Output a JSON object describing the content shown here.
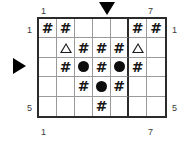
{
  "puzzle": {
    "title": "grid-puzzle",
    "rows": 5,
    "columns": 7,
    "colors": {
      "border": "#2b2b2b",
      "gridline": "#9a9a9a",
      "glyph": "#0d0d0d",
      "label": "#3a3a3a",
      "background": "#ffffff"
    },
    "labels": {
      "top_left": "1",
      "top_right": "7",
      "bottom_left": "1",
      "bottom_right": "7",
      "left_top": "1",
      "left_bottom": "5",
      "right_top": "1",
      "right_bottom": "5"
    },
    "markers": {
      "top_arrow": "down-triangle-marker",
      "top_arrow_column": 4,
      "left_arrow": "right-triangle-marker",
      "left_arrow_row": 3
    },
    "thick_divider_after_column": 5,
    "glyph_names": {
      "hash": "hash-glyph",
      "disc": "filled-circle-glyph",
      "triangle": "open-triangle-glyph",
      "empty": "empty-cell"
    },
    "glyph_chars": {
      "hash": "#"
    },
    "cells": [
      [
        "hash",
        "hash",
        "",
        "",
        "",
        "hash",
        "hash"
      ],
      [
        "",
        "triangle",
        "hash",
        "hash",
        "hash",
        "triangle",
        ""
      ],
      [
        "",
        "hash",
        "disc",
        "hash",
        "disc",
        "hash",
        ""
      ],
      [
        "",
        "",
        "hash",
        "disc",
        "hash",
        "",
        ""
      ],
      [
        "",
        "",
        "",
        "hash",
        "",
        "",
        ""
      ]
    ]
  }
}
